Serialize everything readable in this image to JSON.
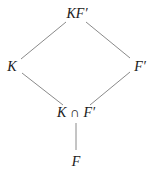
{
  "diagram": {
    "type": "field-lattice",
    "nodes": [
      {
        "id": "top",
        "label": "KF′",
        "x": 77,
        "y": 14
      },
      {
        "id": "left",
        "label": "K",
        "x": 12,
        "y": 67
      },
      {
        "id": "right",
        "label": "F′",
        "x": 140,
        "y": 67
      },
      {
        "id": "meet",
        "label": "K ∩ F′",
        "x": 76,
        "y": 113
      },
      {
        "id": "bottom",
        "label": "F",
        "x": 76,
        "y": 162
      }
    ],
    "edges": [
      {
        "from": "top",
        "to": "left",
        "x1": 66,
        "y1": 22,
        "x2": 21,
        "y2": 59
      },
      {
        "from": "top",
        "to": "right",
        "x1": 86,
        "y1": 22,
        "x2": 130,
        "y2": 58
      },
      {
        "from": "left",
        "to": "meet",
        "x1": 22,
        "y1": 73,
        "x2": 63,
        "y2": 105
      },
      {
        "from": "right",
        "to": "meet",
        "x1": 130,
        "y1": 72,
        "x2": 90,
        "y2": 105
      },
      {
        "from": "meet",
        "to": "bottom",
        "x1": 76,
        "y1": 123,
        "x2": 76,
        "y2": 150
      }
    ],
    "line_color": "#8a8a8a",
    "text_color": "#1a1a1a"
  }
}
